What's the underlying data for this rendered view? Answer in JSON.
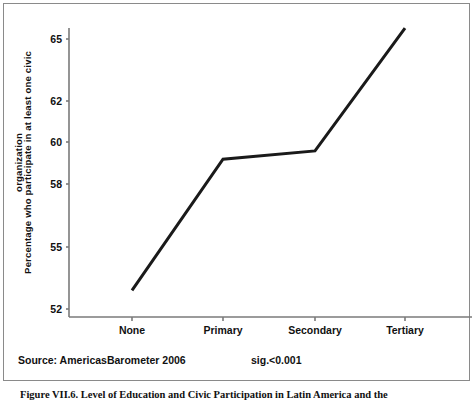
{
  "figure": {
    "caption": "Figure VII.6. Level of Education and Civic Participation in Latin America and the",
    "source_note": "Source: AmericasBarometer 2006",
    "sig_note": "sig.<0.001"
  },
  "chart_data": {
    "type": "line",
    "title": "",
    "xlabel": "",
    "ylabel": "Percentage who participate in at least one civic organization",
    "ylabel_lines": [
      "Percentage who participate in at least one civic",
      "organization"
    ],
    "categories": [
      "None",
      "Primary",
      "Secondary",
      "Tertiary"
    ],
    "values": [
      52.9,
      59.2,
      59.6,
      65.5
    ],
    "series": [
      {
        "name": "Percentage who participate in at least one civic organization",
        "values": [
          52.9,
          59.2,
          59.6,
          65.5
        ]
      }
    ],
    "ytick_labels": [
      "65",
      "62",
      "60",
      "58",
      "55",
      "52"
    ],
    "ytick_values": [
      65,
      62,
      60,
      58,
      55,
      52
    ],
    "ylim": [
      51.3,
      66.4
    ],
    "grid": false,
    "legend": "none",
    "line_color": "#1a1a1a",
    "axis_color": "#7a7a7a",
    "line_width": 3
  }
}
